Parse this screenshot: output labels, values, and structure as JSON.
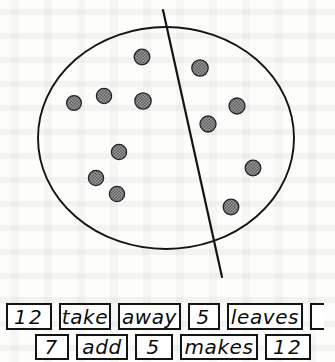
{
  "worksheet": {
    "title": "Division of counters into two groups with number-sentence cards",
    "diagram": {
      "shape_name": "ellipse",
      "divider_name": "partition-line",
      "total_counters": 12,
      "left_group_count": 7,
      "right_group_count": 5,
      "counter_fill": "#8a8a8a",
      "outline_color": "#111111",
      "left_counters": [
        {
          "cx": 74,
          "cy": 103
        },
        {
          "cx": 104,
          "cy": 96
        },
        {
          "cx": 142,
          "cy": 57
        },
        {
          "cx": 143,
          "cy": 101
        },
        {
          "cx": 119,
          "cy": 152
        },
        {
          "cx": 96,
          "cy": 178
        },
        {
          "cx": 117,
          "cy": 194
        }
      ],
      "right_counters": [
        {
          "cx": 200,
          "cy": 68
        },
        {
          "cx": 208,
          "cy": 124
        },
        {
          "cx": 237,
          "cy": 106
        },
        {
          "cx": 253,
          "cy": 168
        },
        {
          "cx": 231,
          "cy": 207
        }
      ],
      "ellipse": {
        "cx": 166,
        "cy": 138,
        "rx": 128,
        "ry": 111
      },
      "partition_line": {
        "x1": 163,
        "y1": 10,
        "x2": 222,
        "y2": 277
      }
    },
    "card_rows": [
      {
        "row_name": "take-away-sentence",
        "cards": [
          {
            "text": "12",
            "type": "number",
            "width": 46,
            "clipped": false
          },
          {
            "text": "take",
            "type": "word",
            "width": 52,
            "clipped": false
          },
          {
            "text": "away",
            "type": "word",
            "width": 63,
            "clipped": false
          },
          {
            "text": "5",
            "type": "number",
            "width": 32,
            "clipped": false
          },
          {
            "text": "leaves",
            "type": "word",
            "width": 76,
            "clipped": false
          },
          {
            "text": "",
            "type": "blank",
            "width": 14,
            "clipped": true
          }
        ]
      },
      {
        "row_name": "addition-sentence",
        "cards": [
          {
            "text": "7",
            "type": "number",
            "width": 34,
            "clipped": false
          },
          {
            "text": "add",
            "type": "word",
            "width": 52,
            "clipped": false
          },
          {
            "text": "5",
            "type": "number",
            "width": 38,
            "clipped": false
          },
          {
            "text": "makes",
            "type": "word",
            "width": 78,
            "clipped": false
          },
          {
            "text": "12",
            "type": "number",
            "width": 46,
            "clipped": false
          }
        ]
      }
    ]
  }
}
